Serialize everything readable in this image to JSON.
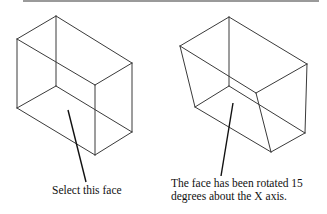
{
  "figure": {
    "type": "diagram",
    "line_color": "#3a3a3a",
    "left": {
      "caption": "Select this face",
      "description": "Rectangular box wireframe with bottom face indicated"
    },
    "right": {
      "caption_line1": "The face has been rotated 15",
      "caption_line2": "degrees about the X axis.",
      "description": "Box wireframe after face rotation of 15 degrees about X axis"
    }
  }
}
